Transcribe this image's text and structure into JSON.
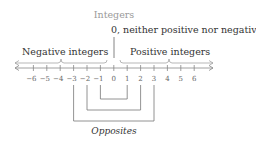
{
  "title": "Integers",
  "zero_label": "0, neither positive nor negative",
  "negative_label": "Negative integers",
  "positive_label": "Positive integers",
  "opposites_label": "Opposites",
  "number_line": {
    "ticks": [
      "−6",
      "−5",
      "−4",
      "−3",
      "−2",
      "−1",
      "0",
      "1",
      "2",
      "3",
      "4",
      "5",
      "6"
    ]
  },
  "opposite_pairs": [
    {
      "a": "−1",
      "b": "1"
    },
    {
      "a": "−2",
      "b": "2"
    },
    {
      "a": "−3",
      "b": "3"
    }
  ],
  "colors": {
    "title": "#9a9a9a",
    "text": "#3a3a3a",
    "line": "#8a8a8a",
    "tick_label": "#666666"
  }
}
